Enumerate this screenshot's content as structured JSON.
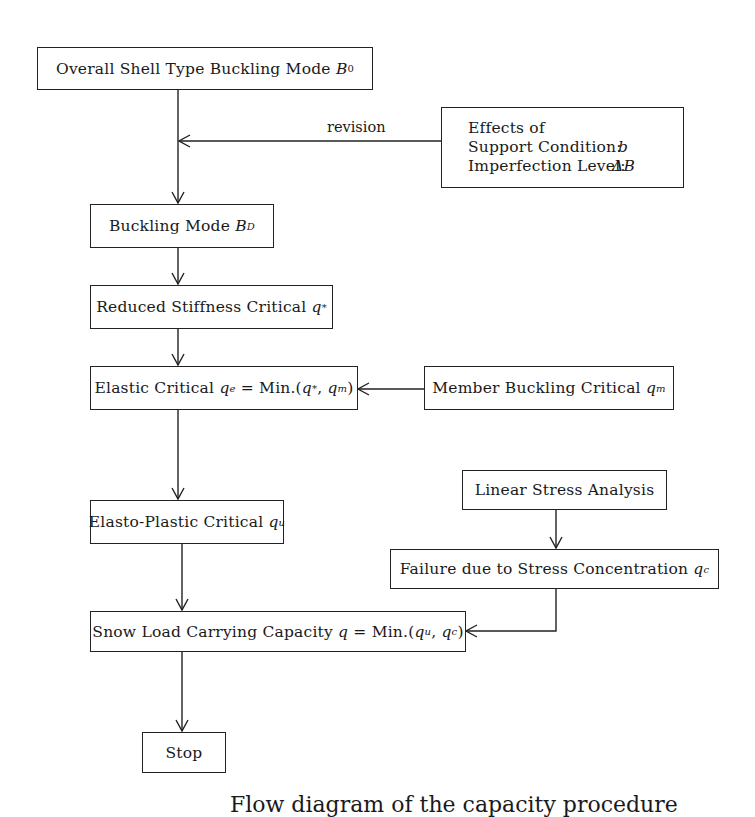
{
  "diagram": {
    "nodes": {
      "overall": {
        "text": "Overall Shell Type Buckling Mode ",
        "symbol": "B",
        "sub": "0"
      },
      "effects": {
        "title": "Effects of",
        "support_label": "Support Condition:",
        "support_value": "b",
        "imperfection_label": "Imperfection Level:",
        "imperfection_value": "ΔB"
      },
      "buckling_mode": {
        "text": "Buckling Mode ",
        "symbol": "B",
        "sub": "D"
      },
      "reduced": {
        "text": "Reduced Stiffness Critical ",
        "symbol": "q",
        "sup": "*"
      },
      "elastic": {
        "text": "Elastic Critical ",
        "formula": "q^e = Min.(q*, q^m)",
        "q": "q",
        "sup_e": "e",
        "eq": " = Min.(",
        "q1": "q",
        "sup1": "*",
        "comma": ", ",
        "q2": "q",
        "sup2": "m",
        "close": ")"
      },
      "member": {
        "text": "Member Buckling Critical ",
        "symbol": "q",
        "sup": "m"
      },
      "elasto_plastic": {
        "text": "Elasto-Plastic Critical ",
        "symbol": "q",
        "sup": "u"
      },
      "linear_stress": {
        "text": "Linear Stress Analysis"
      },
      "failure": {
        "text": "Failure due to Stress Concentration ",
        "symbol": "q",
        "sup": "c"
      },
      "snow_load": {
        "text": "Snow Load Carrying Capacity ",
        "formula": "q = Min.(q^u, q^c)",
        "q": "q",
        "eq": " = Min.(",
        "q1": "q",
        "sup1": "u",
        "comma": ", ",
        "q2": "q",
        "sup2": "c",
        "close": ")"
      },
      "stop": {
        "text": "Stop"
      }
    },
    "edge_labels": {
      "revision": "revision"
    },
    "edges": [
      [
        "overall",
        "buckling_mode"
      ],
      [
        "effects",
        "overall->buckling_mode",
        "revision"
      ],
      [
        "buckling_mode",
        "reduced"
      ],
      [
        "reduced",
        "elastic"
      ],
      [
        "member",
        "elastic"
      ],
      [
        "elastic",
        "elasto_plastic"
      ],
      [
        "linear_stress",
        "failure"
      ],
      [
        "elasto_plastic",
        "snow_load"
      ],
      [
        "failure",
        "snow_load"
      ],
      [
        "snow_load",
        "stop"
      ]
    ],
    "caption": "Flow diagram of the capacity procedure"
  }
}
